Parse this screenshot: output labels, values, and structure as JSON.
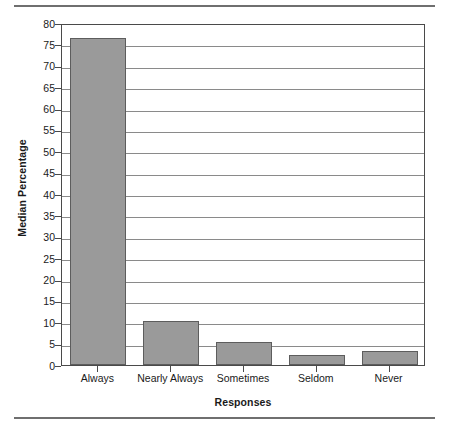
{
  "chart_data": {
    "type": "bar",
    "title": "",
    "xlabel": "Responses",
    "ylabel": "Median Percentage",
    "categories": [
      "Always",
      "Nearly Always",
      "Sometimes",
      "Seldom",
      "Never"
    ],
    "values": [
      76.4,
      10.2,
      5.4,
      2.4,
      3.3
    ],
    "ylim": [
      0,
      80
    ],
    "ytick_step": 5,
    "yticks": [
      0,
      5,
      10,
      15,
      20,
      25,
      30,
      35,
      40,
      45,
      50,
      55,
      60,
      65,
      70,
      75,
      80
    ],
    "ytick_labels": [
      "0",
      "5",
      "10",
      "15",
      "20",
      "25",
      "30",
      "35",
      "40",
      "45",
      "50",
      "55",
      "60",
      "65",
      "70",
      "75",
      "80"
    ],
    "grid": true,
    "grid_axis": "y",
    "legend": false,
    "series": [
      {
        "name": "Median Percentage",
        "values": [
          76.4,
          10.2,
          5.4,
          2.4,
          3.3
        ]
      }
    ],
    "colors": {
      "bar_fill": "#9a9a9a",
      "bar_edge": "#5d5d5d",
      "gridline": "#8a8a8a",
      "axis": "#4a4a4a",
      "rule": "#6f6f6f",
      "text": "#1a1a1a",
      "background": "#ffffff"
    }
  }
}
